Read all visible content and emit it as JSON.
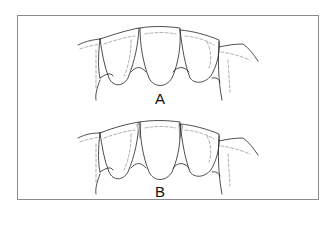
{
  "figure": {
    "type": "dental-illustration",
    "panels": [
      {
        "id": "A",
        "label": "A",
        "variant": "interdental papillae filling embrasures"
      },
      {
        "id": "B",
        "label": "B",
        "variant": "open embrasures with shaded interproximal contacts"
      }
    ]
  },
  "colors": {
    "line": "#222222",
    "dashed": "#9a9a9a",
    "frame": "#8a8a8a",
    "shade": "#c8c8c8"
  }
}
